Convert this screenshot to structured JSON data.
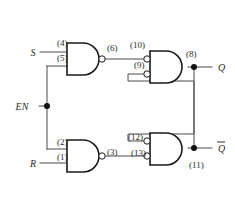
{
  "figure": {
    "kind": "logic-circuit-diagram",
    "name": "Gated SR latch (NAND implementation)",
    "background_color": "#ffffff",
    "wire_color": "#4a4a4a",
    "gate_outline_color": "#1a1a1a",
    "label_color": "#2b2b2b"
  },
  "inputs": [
    {
      "id": "S",
      "label": "S",
      "x": 33,
      "y": 52
    },
    {
      "id": "EN",
      "label": "EN",
      "x": 22,
      "y": 108
    },
    {
      "id": "R",
      "label": "R",
      "x": 33,
      "y": 165
    }
  ],
  "outputs": [
    {
      "id": "Q",
      "label": "Q",
      "overbar": false,
      "x": 216,
      "y": 71
    },
    {
      "id": "Qbar",
      "label": "Q",
      "overbar": true,
      "x": 216,
      "y": 152
    }
  ],
  "gates": [
    {
      "id": "G1",
      "type": "NAND",
      "position": "top-left",
      "input_pins": [
        "(4)",
        "(5)"
      ],
      "output_pin": "(6)"
    },
    {
      "id": "G2",
      "type": "NAND",
      "position": "bottom-left",
      "input_pins": [
        "(2)",
        "(1)"
      ],
      "output_pin": "(3)"
    },
    {
      "id": "G3",
      "type": "NAND",
      "position": "top-right",
      "input_pins": [
        "(10)",
        "(9)"
      ],
      "output_pin": "(8)"
    },
    {
      "id": "G4",
      "type": "NAND",
      "position": "bottom-right",
      "input_pins": [
        "(12)",
        "(13)"
      ],
      "output_pin": "(11)"
    }
  ],
  "pin_labels": [
    {
      "id": "p4",
      "text": "(4)",
      "x": 57,
      "y": 46,
      "anchor": "start"
    },
    {
      "id": "p5",
      "text": "(5)",
      "x": 57,
      "y": 61,
      "anchor": "start"
    },
    {
      "id": "p6",
      "text": "(6)",
      "x": 107,
      "y": 51,
      "anchor": "start"
    },
    {
      "id": "p10",
      "text": "(10)",
      "x": 130,
      "y": 48,
      "anchor": "start"
    },
    {
      "id": "p9",
      "text": "(9)",
      "x": 134,
      "y": 68,
      "anchor": "start"
    },
    {
      "id": "p8",
      "text": "(8)",
      "x": 186,
      "y": 57,
      "anchor": "start"
    },
    {
      "id": "p2",
      "text": "(2)",
      "x": 57,
      "y": 145,
      "anchor": "start"
    },
    {
      "id": "p1",
      "text": "(1)",
      "x": 57,
      "y": 160,
      "anchor": "start"
    },
    {
      "id": "p3",
      "text": "(3)",
      "x": 107,
      "y": 155,
      "anchor": "start"
    },
    {
      "id": "p12",
      "text": "(12)",
      "x": 128,
      "y": 140,
      "anchor": "start"
    },
    {
      "id": "p13",
      "text": "(13)",
      "x": 131,
      "y": 156,
      "anchor": "start"
    },
    {
      "id": "p11",
      "text": "(11)",
      "x": 189,
      "y": 168,
      "anchor": "start"
    }
  ],
  "junction_dots": [
    {
      "id": "en-junction",
      "x": 47,
      "y": 106
    },
    {
      "id": "q-junction",
      "x": 194,
      "y": 67
    },
    {
      "id": "qbar-junction",
      "x": 194,
      "y": 148
    }
  ],
  "connections": [
    {
      "from": "S",
      "to": "G1.(4)"
    },
    {
      "from": "EN",
      "to": "G1.(5)"
    },
    {
      "from": "EN",
      "to": "G2.(2)"
    },
    {
      "from": "R",
      "to": "G2.(1)"
    },
    {
      "from": "G1.(6)",
      "to": "G3.(10)"
    },
    {
      "from": "G2.(3)",
      "to": "G4.(13)"
    },
    {
      "from": "G3.(8) / Q",
      "to": "G4.(12)"
    },
    {
      "from": "G4.(11) / Qbar",
      "to": "G3.(9)"
    }
  ]
}
